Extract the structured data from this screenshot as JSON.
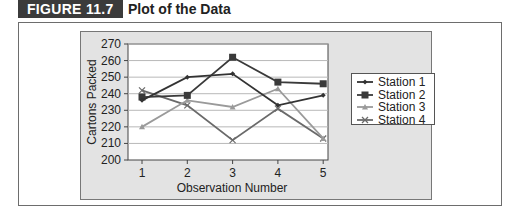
{
  "figure": {
    "label": "FIGURE 11.7",
    "title": "Plot of the Data"
  },
  "chart_data": {
    "type": "line",
    "title": "Plot of the Data",
    "xlabel": "Observation Number",
    "ylabel": "Cartons Packed",
    "x": [
      1,
      2,
      3,
      4,
      5
    ],
    "x_tick_labels": [
      "1",
      "2",
      "3",
      "4",
      "5"
    ],
    "y_tick_labels": [
      "200",
      "210",
      "220",
      "230",
      "240",
      "250",
      "260",
      "270"
    ],
    "ylim": [
      200,
      270
    ],
    "grid": "horizontal",
    "legend_position": "right",
    "series": [
      {
        "name": "Station 1",
        "values": [
          236,
          250,
          252,
          233,
          239
        ],
        "marker": "diamond",
        "color": "#333333"
      },
      {
        "name": "Station 2",
        "values": [
          238,
          239,
          262,
          247,
          246
        ],
        "marker": "square",
        "color": "#3a3a3a"
      },
      {
        "name": "Station 3",
        "values": [
          220,
          236,
          232,
          243,
          213
        ],
        "marker": "triangle",
        "color": "#9a9a9a"
      },
      {
        "name": "Station 4",
        "values": [
          242,
          233,
          212,
          231,
          213
        ],
        "marker": "x",
        "color": "#6a6a6a"
      }
    ]
  }
}
